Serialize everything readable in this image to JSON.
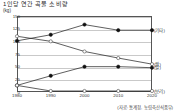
{
  "chart_data": {
    "type": "line",
    "title": "1인당 연간 곡물 소비량",
    "unit_left": "(kg)",
    "source_note": "(자료: 통계청, 농림축산식품부)",
    "xlabel": "",
    "ylabel": "",
    "categories": [
      "1980",
      "1990",
      "2000",
      "2010",
      "2020"
    ],
    "x": [
      1980,
      1990,
      2000,
      2010,
      2020
    ],
    "ylim": [
      0,
      150
    ],
    "yticks": [
      0,
      25,
      50,
      75,
      100,
      125,
      150
    ],
    "ytick_labels": [
      "0",
      "25",
      "50",
      "75",
      "100",
      "125",
      "150"
    ],
    "grid": true,
    "legend_position": "right",
    "series": [
      {
        "name": "(기타)",
        "marker": "filled",
        "right_label": "(기타)",
        "values": [
          101,
          113,
          133,
          122,
          122
        ]
      },
      {
        "name": "(쌀)",
        "marker": "open",
        "right_label": "(쌀)",
        "values": [
          110,
          100,
          80,
          67,
          55
        ]
      },
      {
        "name": "(밀)",
        "marker": "filled",
        "right_label": "(밀)",
        "values": [
          13,
          32,
          50,
          50,
          48
        ]
      },
      {
        "name": "(보리)",
        "marker": "open",
        "right_label": "(보리)",
        "values": [
          13,
          2,
          2,
          2,
          2
        ]
      }
    ]
  }
}
